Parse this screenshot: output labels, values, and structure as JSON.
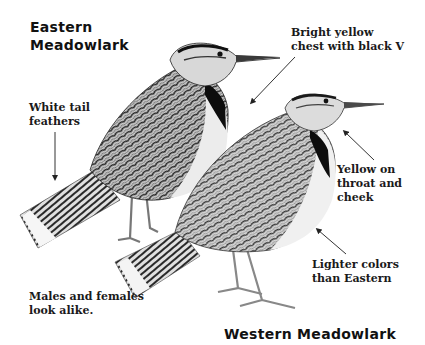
{
  "titles": {
    "eastern": [
      "Eastern",
      "Meadowlark"
    ],
    "western": "Western Meadowlark"
  },
  "annotations": {
    "chest": [
      "Bright yellow",
      "chest with black V"
    ],
    "tail": [
      "White tail",
      "feathers"
    ],
    "throat": [
      "Yellow on",
      "throat and",
      "cheek"
    ],
    "lighter": [
      "Lighter colors",
      "than Eastern"
    ],
    "sexes": [
      "Males and females",
      "look alike."
    ]
  },
  "colors": {
    "ink": "#111111",
    "arrow": "#333333",
    "feather_dark": "#2a2a2a",
    "feather_mid": "#7a7a7a",
    "breast": "#ececec",
    "bib": "#0d0d0d"
  }
}
